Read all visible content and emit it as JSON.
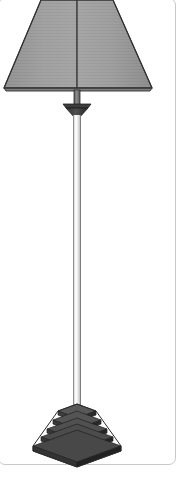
{
  "viewer": {
    "name": "3d-model-viewer",
    "background_color": "#ffffff",
    "border_color": "#c9c9c9",
    "card_radius_px": 7
  },
  "model": {
    "object_name": "floor-lamp",
    "description": "Floor lamp with tapered drum shade, slender column and stepped square pyramid base",
    "outline_color": "#2b2b2b",
    "parts": [
      {
        "name": "lampshade",
        "kind": "truncated-cone-shade",
        "fill": "#9d9d9d",
        "fill_dark": "#8f8f8f",
        "fill_light": "#a8a8a8",
        "top_left_x": 41,
        "top_right_x": 113,
        "bottom_left_x": 4,
        "bottom_right_x": 152,
        "top_y": 0,
        "bottom_y": 88
      },
      {
        "name": "shade-seam",
        "kind": "vertical-seam-line",
        "x": 77,
        "color": "#4a4a4a"
      },
      {
        "name": "harp-rod",
        "kind": "rod",
        "fill": "#6e6e6e",
        "x": 74,
        "width": 6,
        "top_y": 88,
        "bottom_y": 104
      },
      {
        "name": "collar-cap",
        "kind": "inverted-cone-collar",
        "fill": "#3a3a3a",
        "top_y": 103,
        "bottom_y": 116,
        "top_half_width": 14,
        "bottom_half_width": 5
      },
      {
        "name": "column-pole",
        "kind": "cylinder",
        "fill_center": "#f2f2f2",
        "fill_edge": "#b4b4b4",
        "x": 73,
        "width": 8,
        "top_y": 114,
        "bottom_y": 408
      },
      {
        "name": "stepped-base",
        "kind": "stepped-square-pyramid",
        "step_count": 6,
        "top_face_fill": "#5a5a5a",
        "left_face_fill": "#3c3c3c",
        "right_face_fill": "#2a2a2a",
        "center_x": 77,
        "top_y": 404,
        "bottom_y": 452,
        "max_half_width": 44
      }
    ]
  },
  "geometry": {
    "canvas_width": 193,
    "canvas_height": 494,
    "lamp_center_x": 77
  }
}
